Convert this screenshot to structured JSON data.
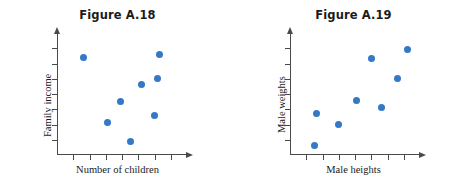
{
  "sheet": {
    "background_color": "#ffffff",
    "point_color": "#3478c8",
    "axis_color": "#4a4a4a"
  },
  "figures": [
    {
      "id": "A.18",
      "title": "Figure A.18",
      "xlabel": "Number of children",
      "ylabel": "Family income"
    },
    {
      "id": "A.19",
      "title": "Figure A.19",
      "xlabel": "Male heights",
      "ylabel": "Male weights"
    }
  ],
  "chart_data": [
    {
      "type": "scatter",
      "title": "Figure A.18",
      "xlabel": "Number of children",
      "ylabel": "Family income",
      "xlim": [
        0,
        8
      ],
      "ylim": [
        0,
        8
      ],
      "grid": false,
      "legend": "none",
      "x_ticks": [
        1,
        2,
        3,
        4,
        5,
        6,
        7
      ],
      "y_ticks": [
        1,
        2,
        3,
        4,
        5,
        6,
        7
      ],
      "x_tick_labels": [],
      "y_tick_labels": [],
      "annotation": "No apparent association between number of children and family income",
      "points": [
        {
          "x": 1.6,
          "y": 6.4
        },
        {
          "x": 3.1,
          "y": 2.1
        },
        {
          "x": 3.9,
          "y": 3.5
        },
        {
          "x": 4.5,
          "y": 0.9
        },
        {
          "x": 5.2,
          "y": 4.6
        },
        {
          "x": 6.0,
          "y": 2.6
        },
        {
          "x": 6.2,
          "y": 5.0
        },
        {
          "x": 6.3,
          "y": 6.6
        }
      ]
    },
    {
      "type": "scatter",
      "title": "Figure A.19",
      "xlabel": "Male heights",
      "ylabel": "Male weights",
      "xlim": [
        0,
        8
      ],
      "ylim": [
        0,
        8
      ],
      "grid": false,
      "legend": "none",
      "x_ticks": [
        1,
        2,
        3,
        4,
        5,
        6,
        7
      ],
      "y_ticks": [
        1,
        2,
        3,
        4,
        5,
        6,
        7
      ],
      "x_tick_labels": [],
      "y_tick_labels": [],
      "annotation": "Positive association between male heights and male weights",
      "points": [
        {
          "x": 1.5,
          "y": 0.6
        },
        {
          "x": 1.6,
          "y": 2.7
        },
        {
          "x": 3.0,
          "y": 2.0
        },
        {
          "x": 4.1,
          "y": 3.6
        },
        {
          "x": 5.0,
          "y": 6.3
        },
        {
          "x": 5.6,
          "y": 3.1
        },
        {
          "x": 6.6,
          "y": 5.0
        },
        {
          "x": 7.2,
          "y": 6.9
        }
      ]
    }
  ]
}
